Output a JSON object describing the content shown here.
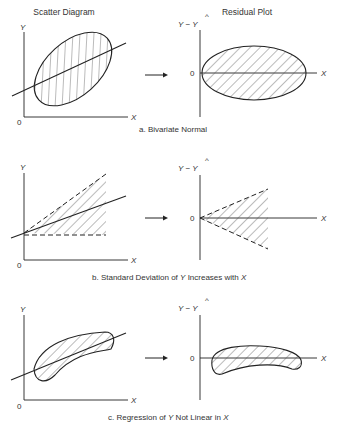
{
  "headers": {
    "left": "Scatter Diagram",
    "right": "Residual Plot"
  },
  "axes": {
    "y": "Y",
    "x": "X",
    "origin": "0",
    "residual_y": "Y − Y",
    "hat": "^",
    "zero": "0"
  },
  "panels": [
    {
      "id": "a",
      "caption": "a. Bivariate Normal",
      "scatter_shape": "tilted ellipse with regression line",
      "residual_shape": "horizontal ellipse centered on 0"
    },
    {
      "id": "b",
      "caption_prefix": "b. Standard Deviation of ",
      "caption_y": "Y",
      "caption_mid": " Increases with ",
      "caption_x": "X",
      "scatter_shape": "dashed fan widening with X",
      "residual_shape": "dashed fan opening to the right"
    },
    {
      "id": "c",
      "caption_prefix": "c. Regression of ",
      "caption_y": "Y",
      "caption_mid": " Not Linear in ",
      "caption_x": "X",
      "scatter_shape": "curved banana band with straight line",
      "residual_shape": "curved band (arch) around 0"
    }
  ],
  "colors": {
    "ink": "#222222",
    "hatch": "#555555",
    "background": "#ffffff"
  }
}
